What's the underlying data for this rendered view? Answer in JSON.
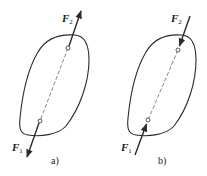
{
  "figure": {
    "panels": [
      {
        "id": "a",
        "caption": "a)",
        "forces": [
          {
            "symbol": "F",
            "subscript": "2",
            "direction": "outward",
            "position": "top"
          },
          {
            "symbol": "F",
            "subscript": "1",
            "direction": "outward",
            "position": "bottom"
          }
        ],
        "description": "Rigid body with two equal and opposite forces pulling outward along the line connecting their points of application"
      },
      {
        "id": "b",
        "caption": "b)",
        "forces": [
          {
            "symbol": "F",
            "subscript": "2",
            "direction": "inward",
            "position": "top"
          },
          {
            "symbol": "F",
            "subscript": "1",
            "direction": "inward",
            "position": "bottom"
          }
        ],
        "description": "Rigid body with two equal and opposite forces pushing inward along the line connecting their points of application"
      }
    ],
    "colors": {
      "line": "#2a2a2a",
      "background": "#ffffff"
    }
  }
}
